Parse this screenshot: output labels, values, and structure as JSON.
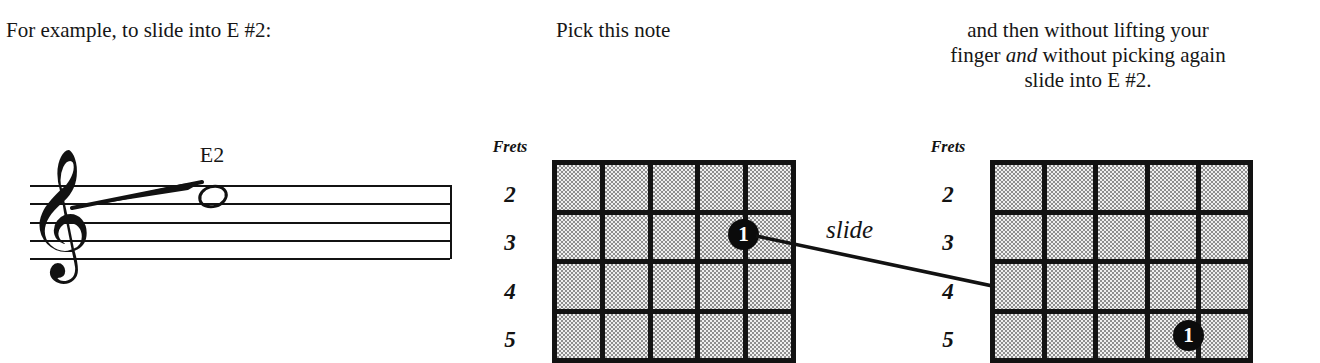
{
  "captions": {
    "intro": "For example, to slide into E #2:",
    "pick": "Pick this note",
    "instruction_line1": "and then without lifting your",
    "instruction_line2_a": "finger ",
    "instruction_line2_em": "and",
    "instruction_line2_b": " without picking again",
    "instruction_line3": "slide into E #2."
  },
  "staff": {
    "note_label": "E2",
    "clef_glyph": "𝄞",
    "note_type": "whole-note",
    "line_count": 5,
    "staff_line_y": [
      49,
      67,
      86,
      104,
      122
    ],
    "slide_indicator": "diagonal-line-into-note"
  },
  "diagrams": [
    {
      "id": "pick-note-diagram",
      "title": "Frets",
      "fret_numbers": [
        "2",
        "3",
        "4",
        "5"
      ],
      "columns": 5,
      "rows": 4,
      "marker": {
        "label": "1",
        "string_line": 4,
        "fret_row": 2
      }
    },
    {
      "id": "slide-target-diagram",
      "title": "Frets",
      "fret_numbers": [
        "2",
        "3",
        "4",
        "5"
      ],
      "columns": 5,
      "rows": 4,
      "marker": {
        "label": "1",
        "string_line": 4,
        "fret_row": 4
      }
    }
  ],
  "annotation": {
    "slide_label": "slide",
    "arrow": "from-first-marker-to-second-marker"
  },
  "colors": {
    "ink": "#121212",
    "grid_fill_light": "#efefef",
    "grid_fill_dark": "#8e8e8e",
    "marker_fill": "#0b0b0b",
    "marker_text": "#ffffff",
    "page_background": "#ffffff"
  }
}
